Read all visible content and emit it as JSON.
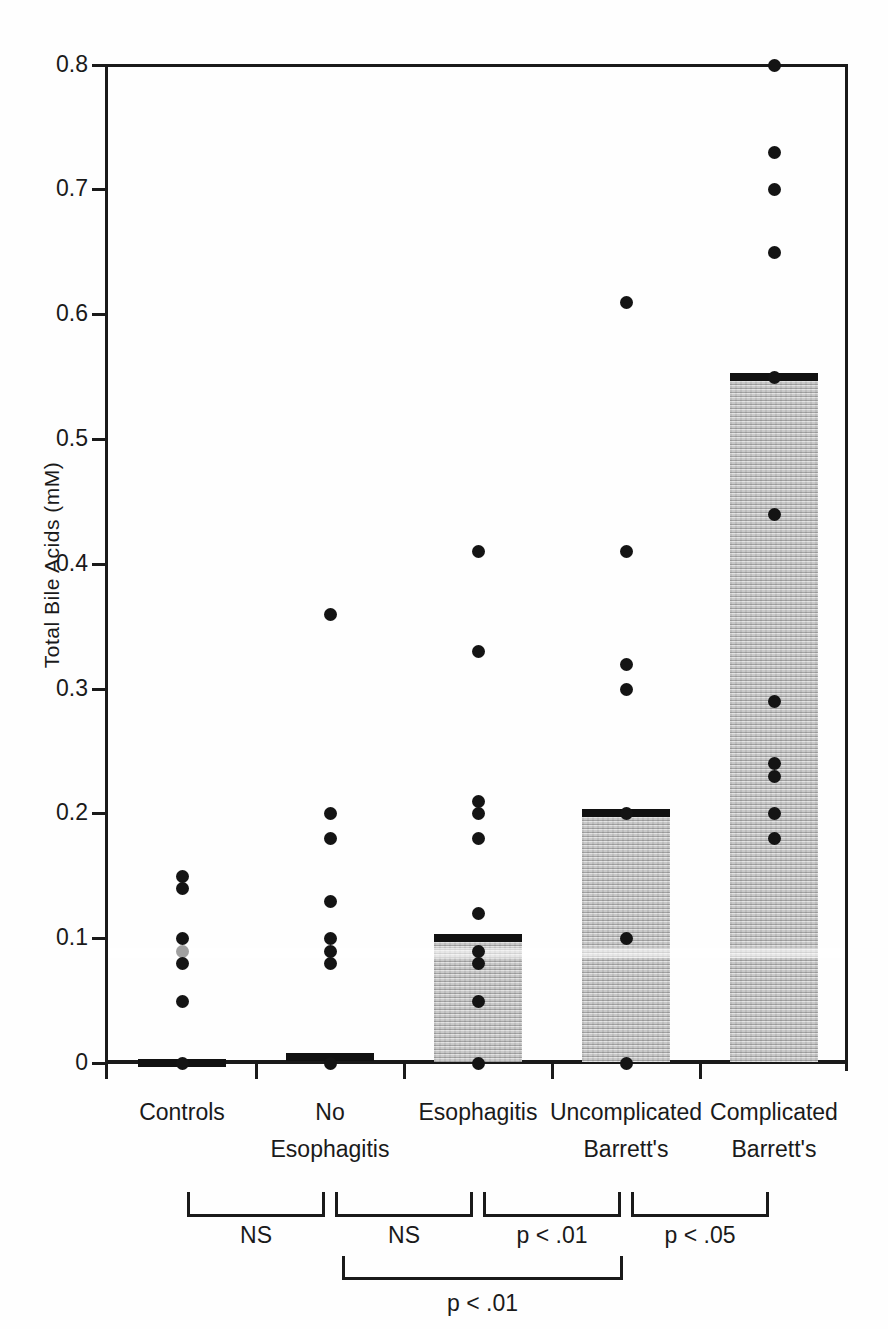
{
  "colors": {
    "ink": "#1a1a1a",
    "dot": "#141414",
    "faded_dot": "#a0a0a0",
    "shade": "#d8d8d8",
    "background": "#fefefe"
  },
  "chart_data": {
    "type": "scatter",
    "title": "",
    "xlabel": "",
    "ylabel": "Total Bile Acids (mM)",
    "ylim": [
      0,
      0.8
    ],
    "ytick_values": [
      0,
      0.1,
      0.2,
      0.3,
      0.4,
      0.5,
      0.6,
      0.7,
      0.8
    ],
    "ytick_labels": [
      "0",
      "0.1",
      "0.2",
      "0.3",
      "0.4",
      "0.5",
      "0.6",
      "0.7",
      "0.8"
    ],
    "grid": false,
    "legend": "none",
    "marker": "filled-circle",
    "bar_style": "stippled-gray-up-to-median",
    "groups": [
      {
        "label_lines": [
          "Controls"
        ],
        "dots": [
          0.15,
          0.14,
          0.1,
          0.08,
          0.05,
          0.0
        ],
        "faded_dots": [
          0.09
        ],
        "median": 0.0,
        "shaded": false
      },
      {
        "label_lines": [
          "No",
          "Esophagitis"
        ],
        "dots": [
          0.36,
          0.2,
          0.18,
          0.13,
          0.1,
          0.09,
          0.08,
          0.0
        ],
        "faded_dots": [],
        "median": 0.005,
        "shaded": false
      },
      {
        "label_lines": [
          "Esophagitis"
        ],
        "dots": [
          0.41,
          0.33,
          0.21,
          0.2,
          0.18,
          0.12,
          0.09,
          0.08,
          0.05,
          0.0
        ],
        "faded_dots": [],
        "median": 0.1,
        "shaded": true
      },
      {
        "label_lines": [
          "Uncomplicated",
          "Barrett's"
        ],
        "dots": [
          0.61,
          0.41,
          0.32,
          0.3,
          0.2,
          0.1,
          0.0
        ],
        "faded_dots": [],
        "median": 0.2,
        "shaded": true
      },
      {
        "label_lines": [
          "Complicated",
          "Barrett's"
        ],
        "dots": [
          0.8,
          0.73,
          0.7,
          0.65,
          0.55,
          0.44,
          0.29,
          0.24,
          0.23,
          0.2,
          0.18
        ],
        "faded_dots": [],
        "median": 0.55,
        "shaded": true
      }
    ],
    "comparisons": [
      {
        "from": 0,
        "to": 1,
        "row": 1,
        "label": "NS"
      },
      {
        "from": 1,
        "to": 2,
        "row": 1,
        "label": "NS"
      },
      {
        "from": 2,
        "to": 3,
        "row": 1,
        "label": "p < .01"
      },
      {
        "from": 3,
        "to": 4,
        "row": 1,
        "label": "p < .05"
      },
      {
        "from": 1,
        "to": 3,
        "row": 2,
        "label": "p < .01"
      }
    ]
  }
}
